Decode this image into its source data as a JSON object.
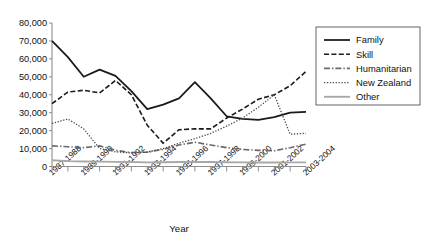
{
  "chart_data": {
    "type": "line",
    "title": "",
    "xlabel": "Year",
    "ylabel": "",
    "ylim": [
      0,
      80000
    ],
    "ytick_labels": [
      "0",
      "10,000",
      "20,000",
      "30,000",
      "40,000",
      "50,000",
      "60,000",
      "70,000",
      "80,000"
    ],
    "ytick_values": [
      0,
      10000,
      20000,
      30000,
      40000,
      50000,
      60000,
      70000,
      80000
    ],
    "grid": false,
    "legend_position": "right",
    "x": [
      "1987-1988",
      "1988-1989",
      "1989-1990",
      "1990-1991",
      "1991-1992",
      "1992-1993",
      "1993-1994",
      "1994-1995",
      "1995-1996",
      "1996-1997",
      "1997-1998",
      "1998-1999",
      "1999-2000",
      "2000-2001",
      "2001-2002",
      "2002-2003",
      "2003-2004"
    ],
    "xtick_labels": [
      "1987-1988",
      "1989-1990",
      "1991-1992",
      "1993-1994",
      "1995-1996",
      "1997-1998",
      "1999-2000",
      "2001-2002",
      "2003-2004"
    ],
    "series": [
      {
        "name": "Family",
        "style": "solid",
        "color": "#1a1a1a",
        "values": [
          70000,
          61000,
          50000,
          54000,
          50500,
          42000,
          32000,
          34500,
          38000,
          47000,
          38000,
          28000,
          26500,
          26000,
          27500,
          30000,
          30500
        ]
      },
      {
        "name": "Skill",
        "style": "dashed",
        "color": "#1a1a1a",
        "values": [
          35000,
          41500,
          42500,
          41000,
          48000,
          40000,
          23000,
          13000,
          20500,
          21000,
          21000,
          27000,
          32000,
          37500,
          40000,
          45000,
          53000
        ]
      },
      {
        "name": "Humanitarian",
        "style": "dashdot",
        "color": "#6a6a6a",
        "values": [
          11500,
          11000,
          10500,
          11500,
          9000,
          7800,
          8000,
          9500,
          12000,
          13500,
          12000,
          10500,
          9500,
          9000,
          8800,
          10500,
          12500
        ]
      },
      {
        "name": "New Zealand",
        "style": "dotted",
        "color": "#4a4a4a",
        "values": [
          24000,
          26500,
          21000,
          10000,
          8200,
          7500,
          8000,
          10000,
          13000,
          15500,
          18500,
          22500,
          27000,
          33000,
          40000,
          18000,
          18500
        ]
      },
      {
        "name": "Other",
        "style": "solid-gray",
        "color": "#a8a8a8",
        "values": [
          3500,
          3000,
          2800,
          2700,
          2600,
          2500,
          2300,
          2400,
          2500,
          2600,
          2500,
          2400,
          2300,
          2200,
          2200,
          2300,
          2300
        ]
      }
    ]
  },
  "legend": {
    "items": [
      {
        "label": "Family"
      },
      {
        "label": "Skill"
      },
      {
        "label": "Humanitarian"
      },
      {
        "label": "New Zealand"
      },
      {
        "label": "Other"
      }
    ]
  },
  "axes": {
    "x_title": "Year"
  }
}
